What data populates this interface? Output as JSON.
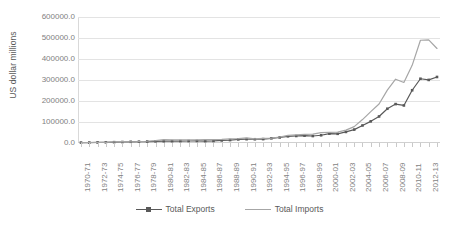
{
  "chart_data": {
    "type": "line",
    "title": "",
    "xlabel": "",
    "ylabel": "US dollar millions",
    "ylim": [
      0,
      600000
    ],
    "ytick_values": [
      0,
      100000,
      200000,
      300000,
      400000,
      500000,
      600000
    ],
    "ytick_labels": [
      "0.0",
      "100000.0",
      "200000.0",
      "300000.0",
      "400000.0",
      "500000.0",
      "600000.0"
    ],
    "grid": true,
    "grid_axis": "y",
    "legend_position": "bottom",
    "x": [
      "1970-71",
      "1971-72",
      "1972-73",
      "1973-74",
      "1974-75",
      "1975-76",
      "1976-77",
      "1977-78",
      "1978-79",
      "1979-80",
      "1980-81",
      "1981-82",
      "1982-83",
      "1983-84",
      "1984-85",
      "1985-86",
      "1986-87",
      "1987-88",
      "1988-89",
      "1989-90",
      "1990-91",
      "1991-92",
      "1992-93",
      "1993-94",
      "1994-95",
      "1995-96",
      "1996-97",
      "1997-98",
      "1998-99",
      "1999-00",
      "2000-01",
      "2001-02",
      "2002-03",
      "2003-04",
      "2004-05",
      "2005-06",
      "2006-07",
      "2007-08",
      "2008-09",
      "2009-10",
      "2010-11",
      "2011-12",
      "2012-13",
      "2013-14"
    ],
    "xtick_labels": [
      "1970-71",
      "1972-73",
      "1974-75",
      "1976-77",
      "1978-79",
      "1980-81",
      "1982-83",
      "1984-85",
      "1986-87",
      "1988-89",
      "1990-91",
      "1992-93",
      "1994-95",
      "1996-97",
      "1998-99",
      "2000-01",
      "2002-03",
      "2004-05",
      "2006-07",
      "2008-09",
      "2010-11",
      "2012-13"
    ],
    "series": [
      {
        "name": "Total Exports",
        "color": "#595959",
        "marker": "square",
        "values": [
          2031,
          2153,
          2551,
          3208,
          3929,
          4665,
          5753,
          6316,
          6978,
          7947,
          8486,
          8704,
          9107,
          9449,
          9878,
          8904,
          9745,
          12089,
          13970,
          16956,
          18143,
          17865,
          18537,
          22238,
          26330,
          31797,
          33470,
          35006,
          33219,
          36822,
          44560,
          43827,
          52719,
          63843,
          83536,
          103091,
          126414,
          163132,
          185295,
          178751,
          251136,
          305964,
          300401,
          314405
        ]
      },
      {
        "name": "Total Imports",
        "color": "#a6a6a6",
        "marker": "none",
        "values": [
          2162,
          2443,
          2388,
          3425,
          5122,
          6084,
          5674,
          6739,
          8302,
          11321,
          15869,
          15174,
          14787,
          15311,
          14412,
          16067,
          15727,
          17156,
          19497,
          21219,
          24073,
          19411,
          21882,
          23306,
          28654,
          36675,
          39133,
          41484,
          42389,
          49671,
          50537,
          51413,
          61412,
          78149,
          111517,
          149166,
          185735,
          251654,
          303696,
          288373,
          369769,
          489319,
          490737,
          450200
        ]
      }
    ]
  }
}
